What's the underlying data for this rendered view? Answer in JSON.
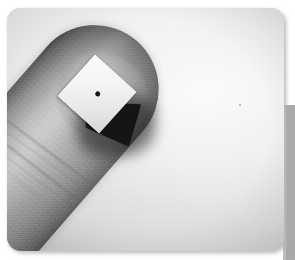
{
  "media": {
    "type": "photograph",
    "color_mode": "grayscale",
    "caption": "",
    "subject": "human fingertip holding a small white square chip",
    "orientation": "finger angled diagonally from lower-right to upper-left"
  },
  "frame": {
    "corner_style": "rounded",
    "corner_radius_px": 14,
    "photo_left_px": 7,
    "photo_top_px": 8,
    "photo_width_px": 277,
    "photo_height_px": 243,
    "page_background_color": "#ffffff",
    "drop_shadow_color": "#b5b5b5"
  },
  "edge_band": {
    "label": "right edge gray band",
    "color": "#a9a9a9",
    "highlight_color": "#bdbdbd",
    "left_px": 283,
    "top_px": 105,
    "width_px": 12,
    "height_px": 155
  },
  "backdrop": {
    "description": "smooth studio gradient backdrop, bright at upper right, darker at edges",
    "highlight_color": "#fbfbfa",
    "midtone_color": "#dededb",
    "shadow_color": "#bdbdba"
  },
  "finger": {
    "label": "finger",
    "rotation_deg": 41,
    "skin_highlight_color": "#bcbcb3",
    "skin_midtone_color": "#9a9a92",
    "skin_shadow_color": "#3a3a38",
    "features": [
      "rounded fingertip at upper left",
      "knuckle crease bands across mid finger",
      "fine skin texture striations",
      "nail plate near tip"
    ],
    "crease_count": 5
  },
  "chip": {
    "label": "white square chip",
    "shape": "square",
    "rotation_deg": 42,
    "size_px": 56,
    "face_color": "#fdfdfb",
    "edge_color": "#d6d6cf",
    "marking": {
      "label": "center dot",
      "shape": "dot",
      "color": "#15150f",
      "diameter_px": 5
    }
  },
  "cast_shadow": {
    "label": "shadow cast by chip onto fingertip",
    "color": "#121210",
    "soft_color": "rgba(18,18,16,0.55)",
    "direction": "down and to the right of the chip"
  },
  "specks": [
    {
      "label": "dust speck right of finger",
      "x_px": 232,
      "y_px": 96
    },
    {
      "label": "dust speck upper backdrop",
      "x_px": 206,
      "y_px": 36
    },
    {
      "label": "dust speck left backdrop",
      "x_px": 52,
      "y_px": 168
    }
  ]
}
